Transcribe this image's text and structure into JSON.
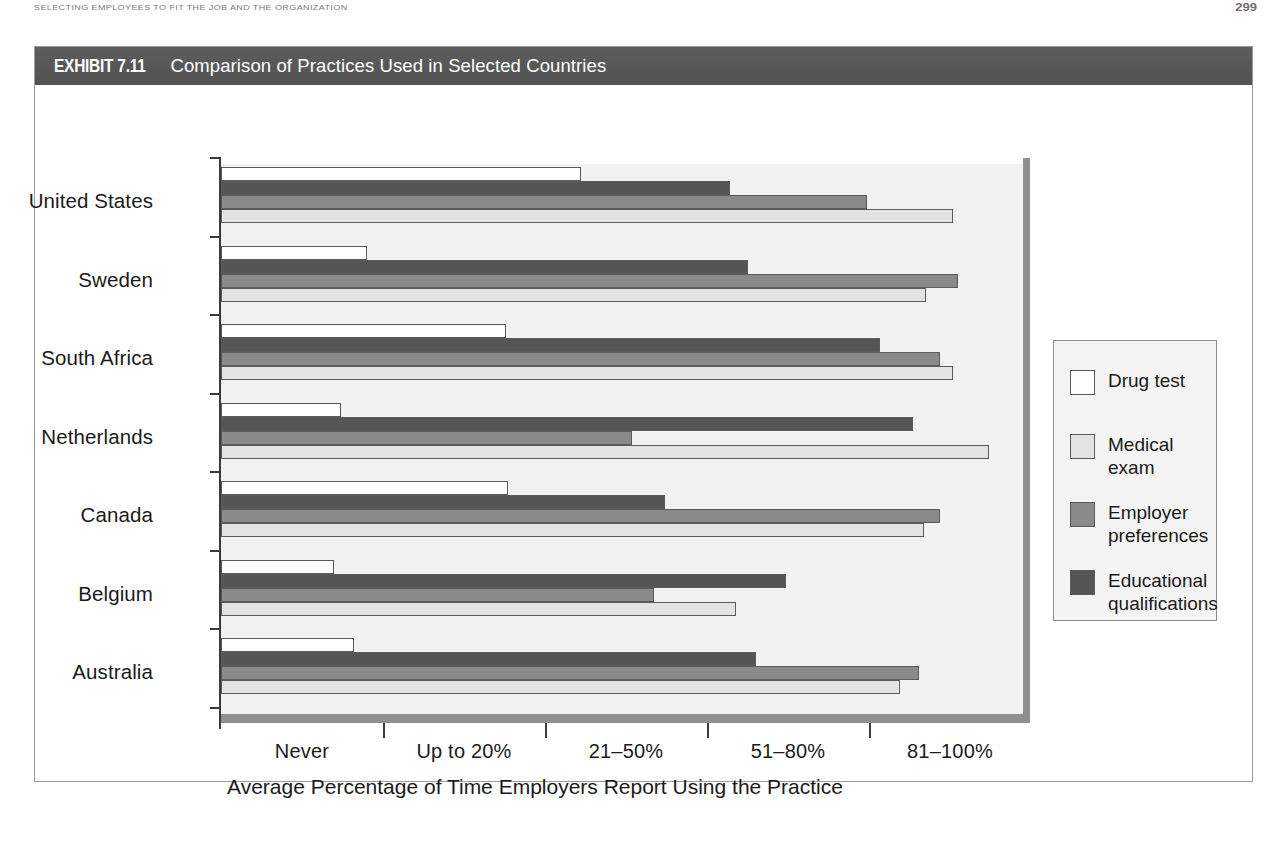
{
  "page": {
    "running_head": "SELECTING EMPLOYEES TO FIT THE JOB AND THE ORGANIZATION",
    "folio": "299"
  },
  "exhibit": {
    "number": "EXHIBIT 7.11",
    "title": "Comparison of Practices Used in Selected Countries"
  },
  "chart_data": {
    "type": "bar",
    "orientation": "horizontal",
    "title": "Comparison of Practices Used in Selected Countries",
    "xlabel": "Average Percentage of Time Employers Report Using the Practice",
    "ylabel": "",
    "grid": false,
    "legend_position": "right",
    "x_tick_labels": [
      "Never",
      "Up to 20%",
      "21–50%",
      "51–80%",
      "81–100%"
    ],
    "x_tick_values": [
      0,
      1,
      2,
      3,
      4
    ],
    "xlim": [
      0,
      5
    ],
    "categories": [
      "United States",
      "Sweden",
      "South Africa",
      "Netherlands",
      "Canada",
      "Belgium",
      "Australia"
    ],
    "series": [
      {
        "name": "Drug test",
        "color": "#ffffff",
        "values": [
          2.22,
          0.9,
          1.76,
          0.74,
          1.77,
          0.7,
          0.82
        ]
      },
      {
        "name": "Medical exam",
        "color": "#e3e3e3",
        "values": [
          4.52,
          4.35,
          4.52,
          4.74,
          4.34,
          3.18,
          4.19
        ]
      },
      {
        "name": "Employer preferences",
        "color": "#8a8a8a",
        "values": [
          3.99,
          4.55,
          4.44,
          2.54,
          4.44,
          2.67,
          4.31
        ]
      },
      {
        "name": "Educational qualifications",
        "color": "#555555",
        "values": [
          3.14,
          3.25,
          4.07,
          4.27,
          2.74,
          3.49,
          3.3
        ]
      }
    ],
    "bar_order_within_group": [
      "Drug test",
      "Educational qualifications",
      "Employer preferences",
      "Medical exam"
    ]
  },
  "legend": {
    "items": [
      {
        "label": "Drug test",
        "color": "#ffffff"
      },
      {
        "label": "Medical\nexam",
        "color": "#e3e3e3"
      },
      {
        "label": "Employer\npreferences",
        "color": "#8a8a8a"
      },
      {
        "label": "Educational\nqualifications",
        "color": "#555555"
      }
    ]
  }
}
